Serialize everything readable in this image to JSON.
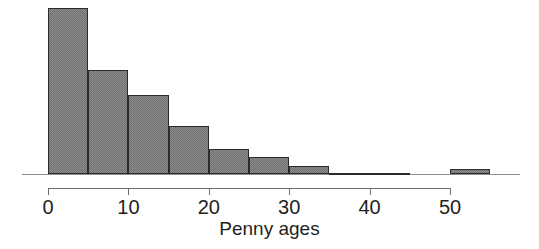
{
  "chart_data": {
    "type": "bar",
    "title": "",
    "subtitle": "",
    "xlabel": "Penny ages",
    "ylabel": "",
    "legend": [],
    "grid": false,
    "bin_width": 5,
    "xlim": [
      0,
      55
    ],
    "ylim": [
      0,
      40
    ],
    "xticks": [
      0,
      10,
      20,
      30,
      40,
      50
    ],
    "xtick_labels": [
      "0",
      "10",
      "20",
      "30",
      "40",
      "50"
    ],
    "bin_edges": [
      0,
      5,
      10,
      15,
      20,
      25,
      30,
      35,
      40,
      45,
      50,
      55
    ],
    "categories": [
      "0-5",
      "5-10",
      "10-15",
      "15-20",
      "20-25",
      "25-30",
      "30-35",
      "35-40",
      "40-45",
      "45-50",
      "50-55"
    ],
    "values": [
      40,
      25,
      19,
      11.5,
      6,
      4,
      2,
      0.3,
      0.3,
      0,
      1.2
    ],
    "bars": [
      {
        "label": "0-5",
        "x0": 0,
        "x1": 5,
        "value": 40
      },
      {
        "label": "5-10",
        "x0": 5,
        "x1": 10,
        "value": 25
      },
      {
        "label": "10-15",
        "x0": 10,
        "x1": 15,
        "value": 19
      },
      {
        "label": "15-20",
        "x0": 15,
        "x1": 20,
        "value": 11.5
      },
      {
        "label": "20-25",
        "x0": 20,
        "x1": 25,
        "value": 6
      },
      {
        "label": "25-30",
        "x0": 25,
        "x1": 30,
        "value": 4
      },
      {
        "label": "30-35",
        "x0": 30,
        "x1": 35,
        "value": 2
      },
      {
        "label": "35-40",
        "x0": 35,
        "x1": 40,
        "value": 0.3
      },
      {
        "label": "40-45",
        "x0": 40,
        "x1": 45,
        "value": 0.3
      },
      {
        "label": "45-50",
        "x0": 45,
        "x1": 50,
        "value": 0
      },
      {
        "label": "50-55",
        "x0": 50,
        "x1": 55,
        "value": 1.2
      }
    ],
    "colors": {
      "bar_fill": "#8e8e8e",
      "bar_hatch": "#6f6f6f",
      "bar_edge": "#2b2b2b",
      "axis": "#6e6e6e",
      "text": "#231f20",
      "background": "#ffffff"
    }
  }
}
